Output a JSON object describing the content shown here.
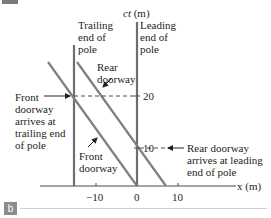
{
  "figure": {
    "panel_label": "b",
    "axes": {
      "y_label_italic": "ct",
      "y_label_unit": " (m)",
      "x_label": "x (m)",
      "x_ticks": [
        "−10",
        "0",
        "10"
      ],
      "y_ticks": [
        "20",
        "10"
      ]
    },
    "labels": {
      "trailing_end": [
        "Trailing",
        "end of",
        "pole"
      ],
      "leading_end": [
        "Leading",
        "end of",
        "pole"
      ],
      "rear_doorway": [
        "Rear",
        "doorway"
      ],
      "front_doorway": [
        "Front",
        "doorway"
      ],
      "front_arrives": [
        "Front",
        "doorway",
        "arrives at",
        "trailing end",
        "of pole"
      ],
      "rear_arrives": [
        "Rear doorway",
        "arrives at leading",
        "end of pole"
      ]
    },
    "colors": {
      "worldline": "#7f7f7f",
      "axis": "#4d4d4d",
      "text": "#231f20",
      "badge": "#8c8c8c"
    }
  }
}
